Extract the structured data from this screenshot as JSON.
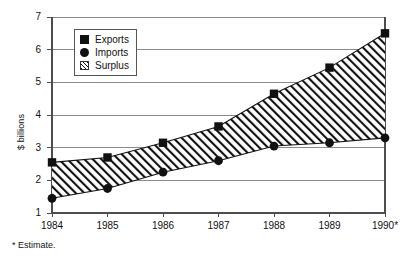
{
  "chart_data": {
    "type": "area",
    "title": "",
    "subtitle": "",
    "xlabel": "",
    "ylabel": "$ billions",
    "categories": [
      "1984",
      "1985",
      "1986",
      "1987",
      "1988",
      "1989",
      "1990*"
    ],
    "x_tick_labels": [
      "1984",
      "1985",
      "1986",
      "1987",
      "1988",
      "1989",
      "1990*"
    ],
    "y_tick_labels": [
      "1",
      "2",
      "3",
      "4",
      "5",
      "6",
      "7"
    ],
    "ylim": [
      1,
      7
    ],
    "y_ticks": [
      1,
      2,
      3,
      4,
      5,
      6,
      7
    ],
    "grid": "horizontal",
    "legend_position": "top-left-inside",
    "series": [
      {
        "name": "Exports",
        "marker": "square",
        "values": [
          2.55,
          2.7,
          3.15,
          3.65,
          4.65,
          5.45,
          6.5
        ]
      },
      {
        "name": "Imports",
        "marker": "circle",
        "values": [
          1.45,
          1.75,
          2.25,
          2.6,
          3.05,
          3.15,
          3.3
        ]
      },
      {
        "name": "Surplus",
        "marker": "hatched-band",
        "values": [
          1.1,
          0.95,
          0.9,
          1.05,
          1.6,
          2.3,
          3.2
        ]
      }
    ],
    "annotations": [
      "* Estimate."
    ],
    "colors": {
      "marker": "#111111",
      "line": "#111111",
      "gridline": "#8a8a8a",
      "axis": "#4d4d4d",
      "hatch": "#111111",
      "background": "#ffffff"
    }
  },
  "legend": {
    "items": [
      {
        "label": "Exports",
        "icon": "filled-square-icon"
      },
      {
        "label": "Imports",
        "icon": "filled-circle-icon"
      },
      {
        "label": "Surplus",
        "icon": "hatched-swatch-icon"
      }
    ]
  },
  "footnote": {
    "text": "* Estimate."
  }
}
